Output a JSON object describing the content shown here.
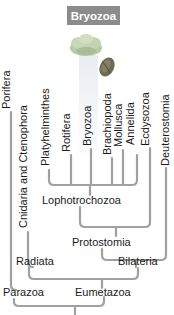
{
  "title": "Bryozoa",
  "taxa": [
    {
      "label": "Porifera"
    },
    {
      "label": "Cnidaria and Ctenophora"
    },
    {
      "label": "Platyhelminthes"
    },
    {
      "label": "Rotifera"
    },
    {
      "label": "Bryozoa"
    },
    {
      "label": "Brachiopoda"
    },
    {
      "label": "Mollusca"
    },
    {
      "label": "Annelida"
    },
    {
      "label": "Ecdysozoa"
    },
    {
      "label": "Deuterostomia"
    }
  ],
  "clades": {
    "lophotrochozoa": "Lophotrochozoa",
    "protostomia": "Protostomia",
    "radiata": "Radiata",
    "bilateria": "Bilateria",
    "parazoa": "Parazoa",
    "eumetazoa": "Eumetazoa"
  },
  "colors": {
    "title_bg": "#8c8c8c",
    "branch": "#a0a0a0",
    "highlight": "#e6ebf0"
  }
}
